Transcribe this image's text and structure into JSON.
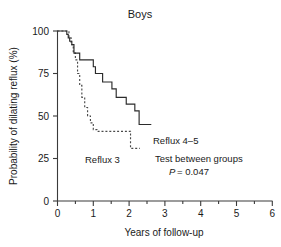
{
  "chart_data": {
    "type": "line",
    "title": "Boys",
    "xlabel": "Years of follow-up",
    "ylabel": "Probability of dilating reflux (%)",
    "xlim": [
      0,
      6
    ],
    "ylim": [
      0,
      100
    ],
    "xticks": [
      0,
      1,
      2,
      3,
      4,
      5,
      6
    ],
    "xticklabels": [
      "0",
      "1",
      "2",
      "3",
      "4",
      "5",
      "6"
    ],
    "xminorticks": [
      0.5,
      1.5,
      2.5,
      3.5,
      4.5,
      5.5
    ],
    "yticks": [
      0,
      25,
      50,
      75,
      100
    ],
    "yticklabels": [
      "0",
      "25",
      "50",
      "75",
      "100"
    ],
    "grid": false,
    "legend_position": "inline-annotation",
    "series": [
      {
        "name": "Reflux 4-5",
        "style": "solid",
        "label": "Reflux 4–5",
        "x": [
          0.0,
          0.22,
          0.26,
          0.3,
          0.34,
          0.4,
          0.46,
          0.5,
          0.62,
          0.78,
          0.92,
          1.0,
          1.06,
          1.14,
          1.26,
          1.4,
          1.52,
          1.64,
          1.78,
          1.92,
          2.04,
          2.16,
          2.28,
          2.62
        ],
        "y": [
          100,
          100,
          98,
          96,
          94,
          92,
          87,
          87,
          83,
          83,
          83,
          79,
          75,
          75,
          70,
          70,
          66,
          61,
          61,
          57,
          57,
          53,
          45,
          45
        ]
      },
      {
        "name": "Reflux 3",
        "style": "dashed",
        "label": "Reflux 3",
        "x": [
          0.0,
          0.26,
          0.32,
          0.38,
          0.44,
          0.5,
          0.56,
          0.62,
          0.68,
          0.76,
          0.84,
          0.92,
          1.0,
          1.1,
          1.9,
          2.04,
          2.3
        ],
        "y": [
          100,
          100,
          96,
          92,
          87,
          83,
          75,
          68,
          61,
          55,
          50,
          46,
          42,
          41,
          41,
          31,
          31
        ]
      }
    ],
    "annotations": [
      {
        "id": "series-label-reflux45",
        "text": "Reflux 4–5",
        "x": 2.65,
        "y": 51
      },
      {
        "id": "series-label-reflux3",
        "text": "Reflux 3",
        "x": 0.78,
        "y": 33
      },
      {
        "id": "test-label",
        "text": "Test between groups",
        "x": 2.7,
        "y": 40
      },
      {
        "id": "pvalue-italic",
        "text": "P",
        "x": 3.1,
        "y": 33
      },
      {
        "id": "pvalue-rest",
        "text": "= 0.047",
        "x": 3.28,
        "y": 33
      }
    ]
  },
  "figure": {
    "title": "Boys",
    "x_axis_label": "Years of follow-up",
    "y_axis_label": "Probability of dilating reflux (%)",
    "x_tick_labels": [
      "0",
      "1",
      "2",
      "3",
      "4",
      "5",
      "6"
    ],
    "y_tick_labels": [
      "0",
      "25",
      "50",
      "75",
      "100"
    ],
    "annotation_reflux_45": "Reflux 4–5",
    "annotation_reflux_3": "Reflux 3",
    "annotation_test": "Test between groups",
    "annotation_p_symbol": "P",
    "annotation_p_value": "= 0.047"
  },
  "colors": {
    "axis": "#3a3a3a",
    "solid_curve": "#2b2b2b",
    "dashed_curve": "#4a4a4a",
    "text": "#1a1a1a",
    "background": "#ffffff"
  }
}
